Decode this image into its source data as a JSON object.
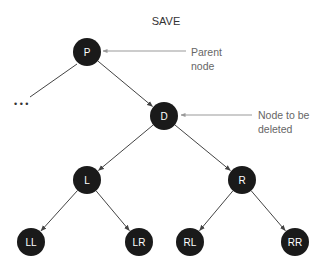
{
  "title": "SAVE",
  "nodes": [
    {
      "id": "P",
      "label": "P"
    },
    {
      "id": "D",
      "label": "D"
    },
    {
      "id": "L",
      "label": "L"
    },
    {
      "id": "R",
      "label": "R"
    },
    {
      "id": "LL",
      "label": "LL"
    },
    {
      "id": "LR",
      "label": "LR"
    },
    {
      "id": "RL",
      "label": "RL"
    },
    {
      "id": "RR",
      "label": "RR"
    }
  ],
  "edges": [
    {
      "from": "P",
      "to": "D"
    },
    {
      "from": "D",
      "to": "L"
    },
    {
      "from": "D",
      "to": "R"
    },
    {
      "from": "L",
      "to": "LL"
    },
    {
      "from": "L",
      "to": "LR"
    },
    {
      "from": "R",
      "to": "RL"
    },
    {
      "from": "R",
      "to": "RR"
    }
  ],
  "ellipsis": "• • •",
  "annotations": {
    "parent": {
      "target": "P",
      "lines": [
        "Parent",
        "node"
      ]
    },
    "delete": {
      "target": "D",
      "lines": [
        "Node to be",
        "deleted"
      ]
    }
  },
  "colors": {
    "node": "#1a1a1a",
    "edge": "#444444",
    "annotation_line": "#999999"
  }
}
